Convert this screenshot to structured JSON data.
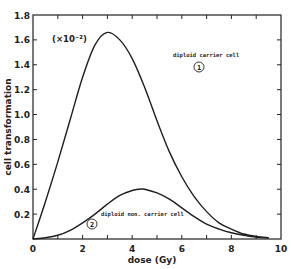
{
  "chart_data": {
    "type": "line",
    "title": "",
    "xlabel": "dose (Gy)",
    "ylabel": "cell transformation",
    "y_scale_note": "(×10⁻²)",
    "xlim": [
      0,
      10
    ],
    "ylim": [
      0,
      1.8
    ],
    "x_ticks": [
      0,
      2,
      4,
      6,
      8,
      10
    ],
    "x_minor_ticks": [
      1,
      3,
      5,
      7,
      9
    ],
    "y_ticks": [
      0.2,
      0.4,
      0.6,
      0.8,
      1.0,
      1.2,
      1.4,
      1.6,
      1.8
    ],
    "y_tick_labels": [
      "0.2",
      "0.4",
      "0.6",
      "0.8",
      "1.0",
      "1.2",
      "1.4",
      "1.6",
      "1.8"
    ],
    "x_tick_labels": [
      "0",
      "2",
      "4",
      "6",
      "8",
      "10"
    ],
    "grid": false,
    "legend": "inline annotations",
    "series": [
      {
        "name": "diploid carrier cell",
        "marker_label": "1",
        "x": [
          0,
          0.5,
          1,
          1.5,
          2,
          2.5,
          3,
          3.5,
          4,
          4.5,
          5,
          5.5,
          6,
          6.5,
          7,
          7.5,
          8,
          8.5,
          9,
          9.5
        ],
        "values": [
          0,
          0.3,
          0.62,
          0.96,
          1.3,
          1.56,
          1.66,
          1.6,
          1.45,
          1.22,
          0.95,
          0.7,
          0.5,
          0.34,
          0.22,
          0.13,
          0.08,
          0.04,
          0.02,
          0.01
        ]
      },
      {
        "name": "diploid non. carrier cell",
        "marker_label": "2",
        "x": [
          0,
          0.5,
          1,
          1.5,
          2,
          2.5,
          3,
          3.5,
          4,
          4.3,
          4.5,
          5,
          5.5,
          6,
          6.5,
          7,
          7.5,
          8,
          8.5,
          9,
          9.5
        ],
        "values": [
          0,
          0.01,
          0.03,
          0.07,
          0.13,
          0.2,
          0.28,
          0.35,
          0.39,
          0.4,
          0.4,
          0.37,
          0.32,
          0.25,
          0.18,
          0.12,
          0.08,
          0.05,
          0.03,
          0.015,
          0.01
        ]
      }
    ],
    "annotations": [
      {
        "text": "diploid carrier cell",
        "x": 4.3,
        "y": 1.57
      },
      {
        "text": "diploid non. carrier cell",
        "x": 3.4,
        "y": 0.24
      }
    ]
  }
}
